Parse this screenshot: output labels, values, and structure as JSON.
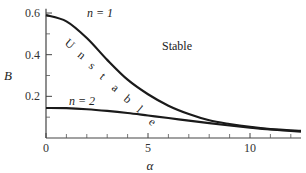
{
  "chart_data": {
    "type": "line",
    "title": "",
    "xlabel": "α",
    "ylabel": "B",
    "xlim": [
      0,
      12.5
    ],
    "ylim": [
      0,
      0.6
    ],
    "x_ticks": [
      0,
      5,
      10
    ],
    "x_minor_ticks": [
      1,
      2,
      3,
      4,
      6,
      7,
      8,
      9,
      11,
      12
    ],
    "y_ticks": [
      0.2,
      0.4,
      0.6
    ],
    "y_tick_labels": [
      "0.2",
      "0.4",
      "0.6"
    ],
    "x_tick_labels": [
      "0",
      "5",
      "10"
    ],
    "grid": false,
    "legend": "none",
    "series": [
      {
        "name": "n = 1",
        "x": [
          0,
          1,
          2,
          3,
          4,
          5,
          6,
          7,
          8,
          9,
          10,
          11,
          12.5
        ],
        "values": [
          0.59,
          0.56,
          0.48,
          0.375,
          0.28,
          0.21,
          0.155,
          0.115,
          0.085,
          0.067,
          0.053,
          0.043,
          0.034
        ]
      },
      {
        "name": "n = 2",
        "x": [
          0,
          1,
          2,
          3,
          4,
          5,
          6,
          7,
          8,
          9,
          10,
          11,
          12.5
        ],
        "values": [
          0.144,
          0.143,
          0.138,
          0.13,
          0.12,
          0.108,
          0.096,
          0.083,
          0.071,
          0.06,
          0.05,
          0.041,
          0.03
        ]
      }
    ],
    "annotations": [
      {
        "text": "n = 1",
        "x": 2.0,
        "y": 0.56
      },
      {
        "text": "n = 2",
        "x": 1.1,
        "y": 0.165
      },
      {
        "text": "Stable",
        "x": 5.7,
        "y": 0.43
      },
      {
        "text": "Unstable",
        "orientation": "diagonal",
        "along": "between curves"
      }
    ]
  },
  "labels": {
    "xlabel": "α",
    "ylabel": "B",
    "n1": "n = 1",
    "n2": "n = 2",
    "stable": "Stable",
    "unstable_letters": [
      "U",
      "n",
      "s",
      "t",
      "a",
      "b",
      "l",
      "e"
    ]
  }
}
